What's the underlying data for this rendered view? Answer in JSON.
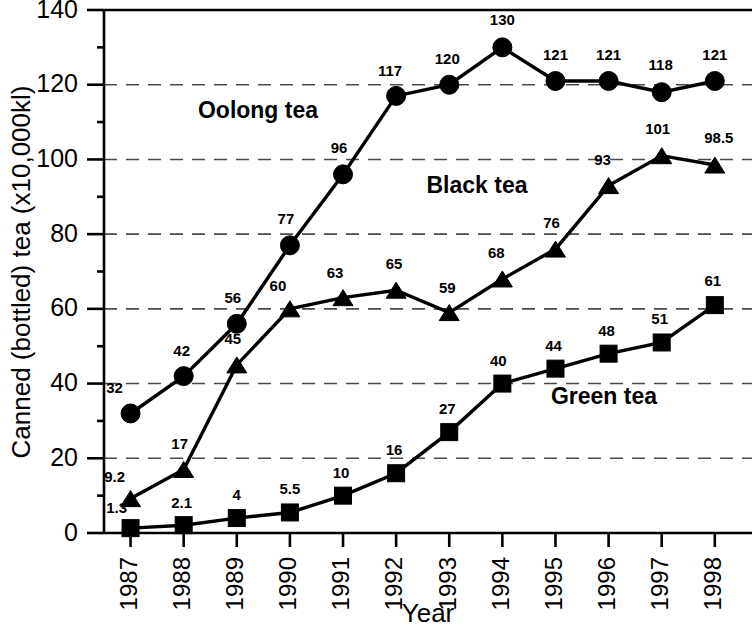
{
  "chart_data": {
    "type": "line",
    "title": "",
    "xlabel": "Year",
    "ylabel": "Canned (bottled) tea (x10,000kl)",
    "categories": [
      "1987",
      "1988",
      "1989",
      "1990",
      "1991",
      "1992",
      "1993",
      "1994",
      "1995",
      "1996",
      "1997",
      "1998"
    ],
    "x": [
      1987,
      1988,
      1989,
      1990,
      1991,
      1992,
      1993,
      1994,
      1995,
      1996,
      1997,
      1998
    ],
    "xlim": [
      1986.5,
      1998.7
    ],
    "ylim": [
      0,
      140
    ],
    "y_ticks": [
      0,
      20,
      40,
      60,
      80,
      100,
      120,
      140
    ],
    "y_minor_ticks": [
      10,
      30,
      50,
      70,
      90,
      110,
      130
    ],
    "grid": "horizontal-dashed-at-major-ticks",
    "legend": "inline-series-labels",
    "series": [
      {
        "name": "Oolong tea",
        "marker": "circle",
        "values": [
          32,
          42,
          56,
          77,
          96,
          117,
          120,
          130,
          121,
          121,
          118,
          121
        ],
        "labels": [
          "32",
          "42",
          "56",
          "77",
          "96",
          "117",
          "120",
          "130",
          "121",
          "121",
          "118",
          "121"
        ],
        "label_position": {
          "x": 258,
          "y": 118
        }
      },
      {
        "name": "Black tea",
        "marker": "triangle",
        "values": [
          9.2,
          17,
          45,
          60,
          63,
          65,
          59,
          68,
          76,
          93,
          101,
          98.5
        ],
        "labels": [
          "9.2",
          "17",
          "45",
          "60",
          "63",
          "65",
          "59",
          "68",
          "76",
          "93",
          "101",
          "98.5"
        ],
        "label_position": {
          "x": 477,
          "y": 193
        }
      },
      {
        "name": "Green tea",
        "marker": "square",
        "values": [
          1.3,
          2.1,
          4,
          5.5,
          10,
          16,
          27,
          40,
          44,
          48,
          51,
          61
        ],
        "labels": [
          "1.3",
          "2.1",
          "4",
          "5.5",
          "10",
          "16",
          "27",
          "40",
          "44",
          "48",
          "51",
          "61"
        ],
        "label_position": {
          "x": 604,
          "y": 404
        }
      }
    ]
  },
  "axes": {
    "y_tick_labels": [
      "0",
      "20",
      "40",
      "60",
      "80",
      "100",
      "120",
      "140"
    ],
    "x_tick_labels": [
      "1987",
      "1988",
      "1989",
      "1990",
      "1991",
      "1992",
      "1993",
      "1994",
      "1995",
      "1996",
      "1997",
      "1998"
    ],
    "y_axis_title": "Canned (bottled) tea (x10,000kl)",
    "x_axis_title": "Year"
  },
  "colors": {
    "ink": "#000000",
    "grid": "#4a4a4a",
    "background": "#ffffff"
  }
}
